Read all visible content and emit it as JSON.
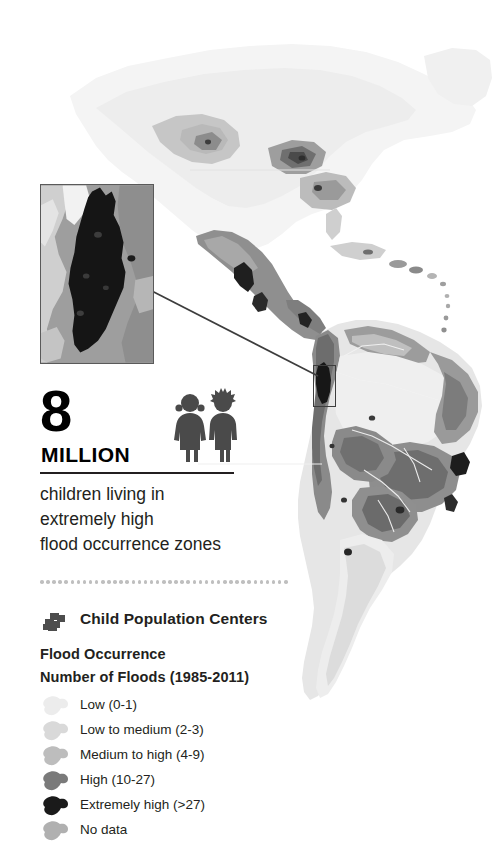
{
  "infographic": {
    "title_number": "8",
    "title_unit": "MILLION",
    "caption": "children living in\nextremely high\nflood occurrence zones",
    "caption_lines": [
      "children living in",
      "extremely high",
      "flood occurrence zones"
    ]
  },
  "legend": {
    "child_centers": {
      "label": "Child Population Centers",
      "icon": "child-population-centers-icon",
      "color": "#4d4d4d"
    },
    "heading_primary": "Flood Occurrence",
    "heading_secondary": "Number of Floods (1985-2011)",
    "items": [
      {
        "label": "Low (0-1)",
        "color": "#ececec",
        "range": "0-1"
      },
      {
        "label": "Low to medium (2-3)",
        "color": "#d9d9d9",
        "range": "2-3"
      },
      {
        "label": "Medium to high (4-9)",
        "color": "#bdbdbd",
        "range": "4-9"
      },
      {
        "label": "High (10-27)",
        "color": "#7a7a7a",
        "range": "10-27"
      },
      {
        "label": "Extremely high (>27)",
        "color": "#1a1a1a",
        "range": ">27"
      },
      {
        "label": "No data",
        "color": "#b0b0b0",
        "range": "n/a"
      }
    ]
  },
  "map": {
    "region": "Americas",
    "inset_region": "Colombia",
    "ocean_color": "#ffffff",
    "divider_color": "#bfbfbf"
  },
  "chart_data": {
    "type": "heatmap",
    "title": "Number of Floods (1985-2011)",
    "subtitle": "Flood Occurrence",
    "annotation": "8 MILLION children living in extremely high flood occurrence zones",
    "legend_position": "bottom-left",
    "categories": [
      "Low (0-1)",
      "Low to medium (2-3)",
      "Medium to high (4-9)",
      "High (10-27)",
      "Extremely high (>27)",
      "No data"
    ],
    "colors": [
      "#ececec",
      "#d9d9d9",
      "#bdbdbd",
      "#7a7a7a",
      "#1a1a1a",
      "#b0b0b0"
    ],
    "value_ranges": [
      [
        0,
        1
      ],
      [
        2,
        3
      ],
      [
        4,
        9
      ],
      [
        10,
        27
      ],
      [
        28,
        null
      ],
      null
    ],
    "highlighted_value": 8000000,
    "highlighted_label": "children living in extremely high flood occurrence zones"
  }
}
